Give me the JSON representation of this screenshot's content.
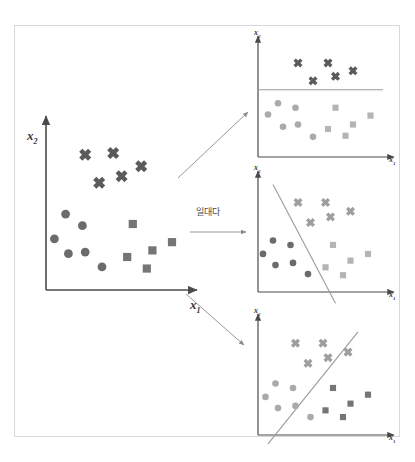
{
  "figure": {
    "title_text": "",
    "border_color": "#d8d8d8",
    "background": "#ffffff",
    "width": 415,
    "height": 462
  },
  "transform_label": {
    "text": "일대다",
    "meaning_icon": "right-arrow-icon"
  },
  "axis_labels": {
    "x": "x",
    "x_sub": "1",
    "y": "x",
    "y_sub": "2"
  },
  "palette": {
    "axis": "#4a4a4a",
    "arrow": "#8c8c8c",
    "boundary": "#9a9a9a",
    "class_cross_dark": "#5b5b5b",
    "class_cross_light": "#9e9e9e",
    "class_circle_dark": "#6b6b6b",
    "class_circle_light": "#aaaaaa",
    "class_square_dark": "#757575",
    "class_square_light": "#b4b4b4"
  },
  "chart_data": {
    "type": "scatter",
    "xlabel": "x1",
    "ylabel": "x2",
    "xlim": [
      0,
      100
    ],
    "ylim": [
      0,
      100
    ],
    "grid": false,
    "legend": "none",
    "classes": [
      {
        "name": "cross",
        "marker": "x",
        "count": 5
      },
      {
        "name": "circle",
        "marker": "circle",
        "count": 6
      },
      {
        "name": "square",
        "marker": "square",
        "count": 5
      }
    ],
    "panels": [
      {
        "id": "main",
        "role": "original-dataset",
        "boundary": null,
        "series": [
          {
            "name": "cross",
            "marker": "x",
            "tone": "dark",
            "points": [
              [
                28,
                82
              ],
              [
                48,
                83
              ],
              [
                68,
                75
              ],
              [
                38,
                65
              ],
              [
                54,
                69
              ]
            ]
          },
          {
            "name": "circle",
            "marker": "circle",
            "tone": "dark",
            "points": [
              [
                14,
                46
              ],
              [
                26,
                39
              ],
              [
                6,
                31
              ],
              [
                16,
                22
              ],
              [
                28,
                23
              ],
              [
                40,
                14
              ]
            ]
          },
          {
            "name": "square",
            "marker": "square",
            "tone": "dark",
            "points": [
              [
                62,
                40
              ],
              [
                90,
                29
              ],
              [
                76,
                24
              ],
              [
                58,
                20
              ],
              [
                72,
                13
              ]
            ]
          }
        ]
      },
      {
        "id": "panel-top",
        "role": "cross-vs-rest",
        "boundary": {
          "type": "line",
          "orientation": "horizontal",
          "x1": 0,
          "y1": 60,
          "x2": 100,
          "y2": 60
        },
        "series": [
          {
            "name": "cross",
            "marker": "x",
            "tone": "dark",
            "points": [
              [
                32,
                84
              ],
              [
                56,
                84
              ],
              [
                76,
                77
              ],
              [
                44,
                68
              ],
              [
                62,
                72
              ]
            ]
          },
          {
            "name": "circle",
            "marker": "circle",
            "tone": "light",
            "points": [
              [
                16,
                48
              ],
              [
                30,
                44
              ],
              [
                8,
                38
              ],
              [
                20,
                27
              ],
              [
                32,
                29
              ],
              [
                44,
                18
              ]
            ]
          },
          {
            "name": "square",
            "marker": "square",
            "tone": "light",
            "points": [
              [
                62,
                44
              ],
              [
                90,
                37
              ],
              [
                76,
                29
              ],
              [
                56,
                25
              ],
              [
                70,
                19
              ]
            ]
          }
        ]
      },
      {
        "id": "panel-middle",
        "role": "circle-vs-rest",
        "boundary": {
          "type": "line",
          "orientation": "steep-negative",
          "x1": 12,
          "y1": 96,
          "x2": 62,
          "y2": -10
        },
        "series": [
          {
            "name": "cross",
            "marker": "x",
            "tone": "light",
            "points": [
              [
                32,
                80
              ],
              [
                54,
                80
              ],
              [
                74,
                72
              ],
              [
                42,
                62
              ],
              [
                58,
                67
              ]
            ]
          },
          {
            "name": "circle",
            "marker": "circle",
            "tone": "dark",
            "points": [
              [
                12,
                46
              ],
              [
                26,
                42
              ],
              [
                4,
                34
              ],
              [
                14,
                24
              ],
              [
                28,
                26
              ],
              [
                40,
                16
              ]
            ]
          },
          {
            "name": "square",
            "marker": "square",
            "tone": "light",
            "points": [
              [
                60,
                42
              ],
              [
                88,
                34
              ],
              [
                74,
                28
              ],
              [
                54,
                22
              ],
              [
                68,
                15
              ]
            ]
          }
        ]
      },
      {
        "id": "panel-bottom",
        "role": "square-vs-rest",
        "boundary": {
          "type": "line",
          "orientation": "positive",
          "x1": 8,
          "y1": -8,
          "x2": 80,
          "y2": 92
        },
        "series": [
          {
            "name": "cross",
            "marker": "x",
            "tone": "light",
            "points": [
              [
                30,
                82
              ],
              [
                52,
                82
              ],
              [
                72,
                74
              ],
              [
                40,
                64
              ],
              [
                56,
                69
              ]
            ]
          },
          {
            "name": "circle",
            "marker": "circle",
            "tone": "light",
            "points": [
              [
                14,
                46
              ],
              [
                28,
                42
              ],
              [
                6,
                34
              ],
              [
                16,
                24
              ],
              [
                30,
                26
              ],
              [
                42,
                16
              ]
            ]
          },
          {
            "name": "square",
            "marker": "square",
            "tone": "dark",
            "points": [
              [
                60,
                42
              ],
              [
                88,
                36
              ],
              [
                74,
                28
              ],
              [
                54,
                22
              ],
              [
                68,
                16
              ]
            ]
          }
        ]
      }
    ],
    "arrows": [
      {
        "name": "arrow-to-top",
        "from": [
          178,
          178
        ],
        "to": [
          248,
          112
        ]
      },
      {
        "name": "arrow-to-middle",
        "from": [
          190,
          232
        ],
        "to": [
          246,
          232
        ]
      },
      {
        "name": "arrow-to-bottom",
        "from": [
          186,
          294
        ],
        "to": [
          244,
          345
        ]
      }
    ]
  }
}
